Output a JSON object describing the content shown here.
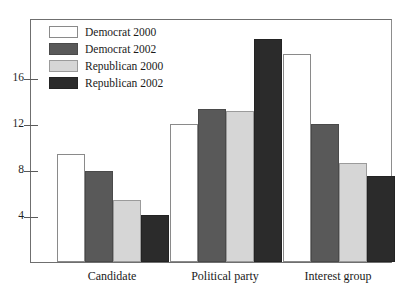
{
  "caption_remnant": "",
  "chart_data": {
    "type": "bar",
    "title": "",
    "subtitle": "",
    "xlabel": "",
    "ylabel": "",
    "categories": [
      "Candidate",
      "Political party",
      "Interest group"
    ],
    "series": [
      {
        "name": "Democrat 2000",
        "color": "#ffffff",
        "values": [
          9.4,
          12.0,
          18.1
        ]
      },
      {
        "name": "Democrat 2002",
        "color": "#595959",
        "values": [
          7.9,
          13.3,
          12.0
        ]
      },
      {
        "name": "Republican 2000",
        "color": "#d6d6d6",
        "values": [
          5.4,
          13.1,
          8.6
        ]
      },
      {
        "name": "Republican 2002",
        "color": "#2b2b2b",
        "values": [
          4.1,
          19.4,
          7.5
        ]
      }
    ],
    "yticks": [
      4,
      8,
      12,
      16
    ],
    "ytick_labels": [
      "4",
      "8",
      "12",
      "16"
    ],
    "ylim": [
      0,
      21
    ],
    "grid": false,
    "legend_position": "top-left-inside",
    "frame": true
  },
  "legend": {
    "entries": [
      {
        "label": "Democrat 2000"
      },
      {
        "label": "Democrat 2002"
      },
      {
        "label": "Republican 2000"
      },
      {
        "label": "Republican 2002"
      }
    ]
  },
  "axis": {
    "y_tick_labels": [
      "16",
      "12",
      "8",
      "4"
    ],
    "x_tick_labels": [
      "Candidate",
      "Political party",
      "Interest group"
    ]
  }
}
